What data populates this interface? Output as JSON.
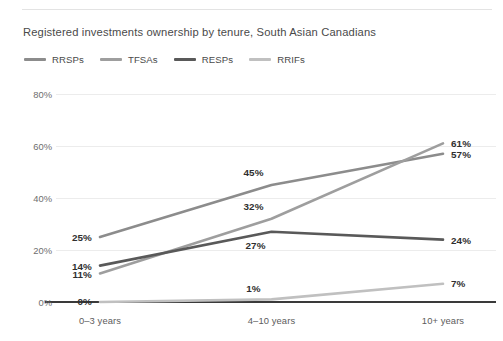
{
  "chart_data": {
    "type": "line",
    "title": "Registered investments ownership by tenure, South Asian Canadians",
    "xlabel": "",
    "ylabel": "",
    "categories": [
      "0–3 years",
      "4–10 years",
      "10+ years"
    ],
    "series": [
      {
        "name": "RRSPs",
        "color": "#8c8c8c",
        "values": [
          25,
          45,
          57
        ],
        "labels": [
          "25%",
          "45%",
          "57%"
        ]
      },
      {
        "name": "TFSAs",
        "color": "#9e9e9e",
        "values": [
          11,
          32,
          61
        ],
        "labels": [
          "11%",
          "32%",
          "61%"
        ]
      },
      {
        "name": "RESPs",
        "color": "#595959",
        "values": [
          14,
          27,
          24
        ],
        "labels": [
          "14%",
          "27%",
          "24%"
        ]
      },
      {
        "name": "RRIFs",
        "color": "#c0c0c0",
        "values": [
          0,
          1,
          7
        ],
        "labels": [
          "0%",
          "1%",
          "7%"
        ]
      }
    ],
    "ylim": [
      0,
      80
    ],
    "yticks": [
      "0%",
      "20%",
      "40%",
      "60%",
      "80%"
    ],
    "ytick_values": [
      0,
      20,
      40,
      60,
      80
    ],
    "grid": true,
    "legend_position": "top-left"
  },
  "legend": {
    "items": [
      {
        "label": "RRSPs"
      },
      {
        "label": "TFSAs"
      },
      {
        "label": "RESPs"
      },
      {
        "label": "RRIFs"
      }
    ]
  }
}
